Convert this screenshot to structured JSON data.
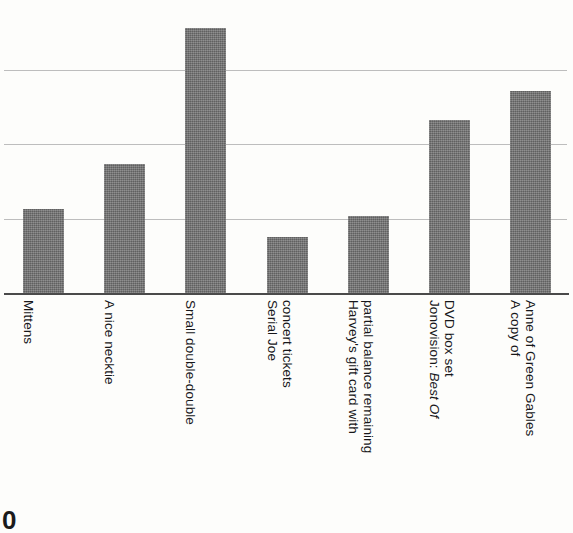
{
  "chart_data": {
    "type": "bar",
    "title": "",
    "subtitle": "",
    "xlabel": "",
    "ylabel": "",
    "grid": true,
    "legend": null,
    "orientation": "vertical",
    "ylim": [
      0,
      4
    ],
    "gridline_values": [
      1,
      2,
      3
    ],
    "categories": [
      "Mittens",
      "A nice necktie",
      "Small double-double",
      "Serial Joe\nconcert tickets",
      "Harvey's gift card with\npartial balance remaining",
      "Jonovision: Best Of\nDVD box set",
      "A copy of\nAnne of Green Gables"
    ],
    "values": [
      1.13,
      1.74,
      3.57,
      0.76,
      1.04,
      2.33,
      2.72
    ],
    "bar_color": "#767676",
    "grid_color": "#bdbdbd",
    "axis_color": "#4a4a4a",
    "background_color": "#fdfdfb"
  },
  "labels": [
    {
      "id": "mittens",
      "lines": [
        {
          "text": "Mittens",
          "italic": false
        }
      ]
    },
    {
      "id": "necktie",
      "lines": [
        {
          "text": "A nice necktie",
          "italic": false
        }
      ]
    },
    {
      "id": "double",
      "lines": [
        {
          "text": "Small double-double",
          "italic": false
        }
      ]
    },
    {
      "id": "serialjoe",
      "lines": [
        {
          "text": "Serial Joe",
          "italic": false
        },
        {
          "text": "concert tickets",
          "italic": false
        }
      ]
    },
    {
      "id": "harveys",
      "lines": [
        {
          "text": "Harvey's gift card with",
          "italic": false
        },
        {
          "text": "partial balance remaining",
          "italic": false
        }
      ]
    },
    {
      "id": "jonovision",
      "lines": [
        {
          "text": "Jonovision: ",
          "italic": false
        },
        {
          "text": "Best Of",
          "italic": true
        },
        {
          "text": "DVD box set",
          "italic": false
        }
      ]
    },
    {
      "id": "annegables",
      "lines": [
        {
          "text": "A copy of",
          "italic": false
        },
        {
          "text": "Anne of Green Gables",
          "italic": false
        }
      ]
    }
  ],
  "page_marker": "0"
}
